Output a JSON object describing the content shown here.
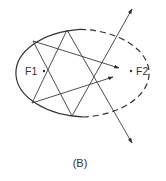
{
  "figure": {
    "caption": "(B)",
    "foci": [
      {
        "label": "F1"
      },
      {
        "label": "F2"
      }
    ],
    "line_color": "#3a3a3a",
    "ellipse_style": {
      "left_half": "solid",
      "right_half": "dashed"
    }
  }
}
